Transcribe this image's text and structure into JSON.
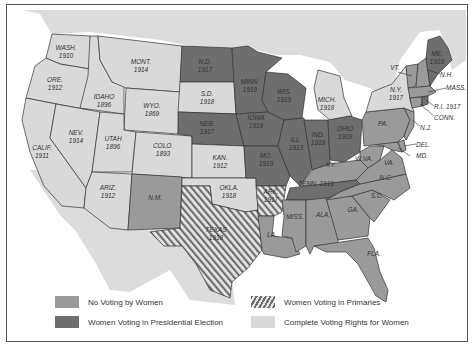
{
  "map": {
    "title": "",
    "colors": {
      "no_voting": "#9a9a9a",
      "presidential": "#6e6e6e",
      "complete": "#d9d9d9",
      "primaries_stripe": "#6e6e6e",
      "foreign_land": "#dcdcdc",
      "water": "#ffffff"
    },
    "states": [
      {
        "abbr": "WASH.",
        "year": "1910",
        "status": "complete"
      },
      {
        "abbr": "ORE.",
        "year": "1912",
        "status": "complete"
      },
      {
        "abbr": "CALIF.",
        "year": "1911",
        "status": "complete"
      },
      {
        "abbr": "IDAHO",
        "year": "1896",
        "status": "complete"
      },
      {
        "abbr": "NEV.",
        "year": "1914",
        "status": "complete"
      },
      {
        "abbr": "MONT.",
        "year": "1914",
        "status": "complete"
      },
      {
        "abbr": "WYO.",
        "year": "1869",
        "status": "complete"
      },
      {
        "abbr": "UTAH",
        "year": "1896",
        "status": "complete"
      },
      {
        "abbr": "COLO.",
        "year": "1893",
        "status": "complete"
      },
      {
        "abbr": "ARIZ.",
        "year": "1912",
        "status": "complete"
      },
      {
        "abbr": "N.M.",
        "year": "",
        "status": "no_voting"
      },
      {
        "abbr": "N.D.",
        "year": "1917",
        "status": "presidential"
      },
      {
        "abbr": "S.D.",
        "year": "1918",
        "status": "complete"
      },
      {
        "abbr": "NEB.",
        "year": "1917",
        "status": "presidential"
      },
      {
        "abbr": "KAN.",
        "year": "1912",
        "status": "complete"
      },
      {
        "abbr": "OKLA.",
        "year": "1918",
        "status": "complete"
      },
      {
        "abbr": "TEXAS",
        "year": "1918",
        "status": "primaries"
      },
      {
        "abbr": "MINN.",
        "year": "1919",
        "status": "presidential"
      },
      {
        "abbr": "IOWA",
        "year": "1919",
        "status": "presidential"
      },
      {
        "abbr": "MO.",
        "year": "1919",
        "status": "presidential"
      },
      {
        "abbr": "ARK.",
        "year": "1917",
        "status": "primaries"
      },
      {
        "abbr": "LA.",
        "year": "",
        "status": "no_voting"
      },
      {
        "abbr": "WIS.",
        "year": "1919",
        "status": "presidential"
      },
      {
        "abbr": "ILL.",
        "year": "1913",
        "status": "presidential"
      },
      {
        "abbr": "MICH.",
        "year": "1918",
        "status": "complete"
      },
      {
        "abbr": "IND.",
        "year": "1919",
        "status": "presidential"
      },
      {
        "abbr": "OHIO",
        "year": "1919",
        "status": "presidential"
      },
      {
        "abbr": "KY.",
        "year": "",
        "status": "no_voting"
      },
      {
        "abbr": "TENN.",
        "year": "1919",
        "status": "presidential"
      },
      {
        "abbr": "MISS.",
        "year": "",
        "status": "no_voting"
      },
      {
        "abbr": "ALA.",
        "year": "",
        "status": "no_voting"
      },
      {
        "abbr": "GA.",
        "year": "",
        "status": "no_voting"
      },
      {
        "abbr": "FLA.",
        "year": "",
        "status": "no_voting"
      },
      {
        "abbr": "S.C.",
        "year": "",
        "status": "no_voting"
      },
      {
        "abbr": "N.C.",
        "year": "",
        "status": "no_voting"
      },
      {
        "abbr": "VA.",
        "year": "",
        "status": "no_voting"
      },
      {
        "abbr": "W.VA.",
        "year": "",
        "status": "no_voting"
      },
      {
        "abbr": "MD.",
        "year": "",
        "status": "no_voting"
      },
      {
        "abbr": "DEL.",
        "year": "",
        "status": "no_voting"
      },
      {
        "abbr": "PA.",
        "year": "",
        "status": "no_voting"
      },
      {
        "abbr": "N.J.",
        "year": "",
        "status": "no_voting"
      },
      {
        "abbr": "N.Y.",
        "year": "1917",
        "status": "complete"
      },
      {
        "abbr": "CONN.",
        "year": "",
        "status": "no_voting"
      },
      {
        "abbr": "R.I.",
        "year": "1917",
        "status": "presidential"
      },
      {
        "abbr": "MASS.",
        "year": "",
        "status": "no_voting"
      },
      {
        "abbr": "VT.",
        "year": "",
        "status": "no_voting"
      },
      {
        "abbr": "N.H.",
        "year": "",
        "status": "no_voting"
      },
      {
        "abbr": "ME.",
        "year": "1919",
        "status": "presidential"
      }
    ]
  },
  "legend": {
    "no_voting": "No Voting by Women",
    "presidential": "Women Voting in Presidential Election",
    "primaries": "Women Voting in Primaries",
    "complete": "Complete Voting Rights for Women"
  },
  "labels": {
    "wash": "WASH.",
    "wash_y": "1910",
    "ore": "ORE.",
    "ore_y": "1912",
    "calif": "CALIF.",
    "calif_y": "1911",
    "idaho": "IDAHO",
    "idaho_y": "1896",
    "nev": "NEV.",
    "nev_y": "1914",
    "mont": "MONT.",
    "mont_y": "1914",
    "wyo": "WYO.",
    "wyo_y": "1869",
    "utah": "UTAH",
    "utah_y": "1896",
    "colo": "COLO.",
    "colo_y": "1893",
    "ariz": "ARIZ.",
    "ariz_y": "1912",
    "nm": "N.M.",
    "nd": "N.D.",
    "nd_y": "1917",
    "sd": "S.D.",
    "sd_y": "1918",
    "neb": "NEB.",
    "neb_y": "1917",
    "kan": "KAN.",
    "kan_y": "1912",
    "okla": "OKLA.",
    "okla_y": "1918",
    "texas": "TEXAS",
    "texas_y": "1918",
    "minn": "MINN.",
    "minn_y": "1919",
    "iowa": "IOWA",
    "iowa_y": "1919",
    "mo": "MO.",
    "mo_y": "1919",
    "ark": "ARK.",
    "ark_y": "1917",
    "la": "LA.",
    "wis": "WIS.",
    "wis_y": "1919",
    "ill": "ILL.",
    "ill_y": "1913",
    "mich": "MICH.",
    "mich_y": "1918",
    "ind": "IND.",
    "ind_y": "1919",
    "ohio": "OHIO",
    "ohio_y": "1919",
    "ky": "KY.",
    "tenn": "TENN.  1919",
    "miss": "MISS.",
    "ala": "ALA.",
    "ga": "GA.",
    "fla": "FLA.",
    "sc": "S.C.",
    "nc": "N.C.",
    "va": "VA.",
    "wva": "W.VA.",
    "md": "MD.",
    "del": "DEL.",
    "pa": "PA.",
    "nj": "N.J.",
    "ny": "N.Y.",
    "ny_y": "1917",
    "conn": "CONN.",
    "ri": "R.I. 1917",
    "mass": "MASS.",
    "vt": "VT.",
    "nh": "N.H.",
    "me": "ME.",
    "me_y": "1919"
  }
}
